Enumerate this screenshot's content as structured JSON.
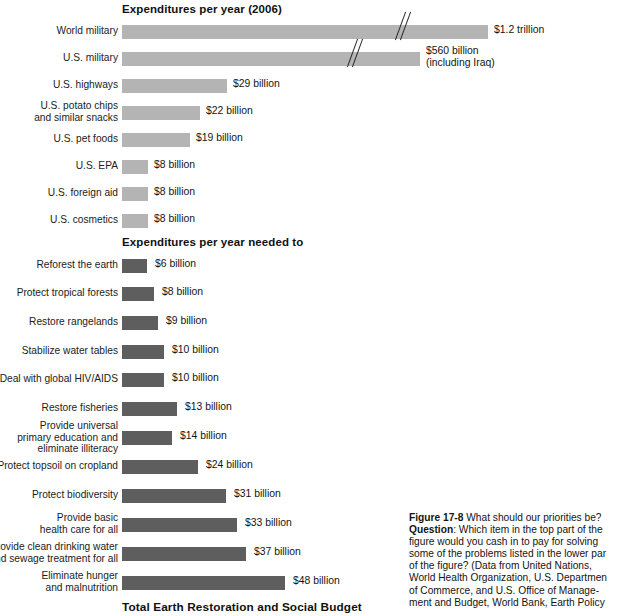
{
  "figure": {
    "top_section_title": "Expenditures per year (2006)",
    "bottom_section_title": "Expenditures per year needed to",
    "total_title": "Total Earth Restoration and Social Budget",
    "colors": {
      "top_bar": "#b4b4b4",
      "bottom_bar": "#5e5e5e",
      "text": "#141414",
      "background": "#ffffff"
    }
  },
  "caption": {
    "figure_number": "Figure 17-8",
    "title_text": " What should our priorities be?",
    "question_label": "Question",
    "question_text": ": Which item in the top part of the",
    "lines": [
      "figure would you cash in to pay for solving",
      "some of the problems listed in the lower par",
      "of the figure? (Data from United Nations,",
      "World Health Organization, U.S. Departmen",
      "of Commerce, and U.S. Office of Manage-",
      "ment and Budget, World Bank, Earth Policy"
    ]
  },
  "chart_data": {
    "type": "bar",
    "title": "What should our priorities be?",
    "xlabel": "",
    "ylabel": "",
    "orientation": "horizontal",
    "grid": false,
    "legend": false,
    "units": "US dollars per year",
    "panels": [
      {
        "name": "Expenditures per year (2006)",
        "bar_color": "#b4b4b4",
        "categories": [
          "World military",
          "U.S. military",
          "U.S. highways",
          "U.S. potato chips\nand similar snacks",
          "U.S. pet foods",
          "U.S. EPA",
          "U.S. foreign aid",
          "U.S. cosmetics"
        ],
        "values": [
          1200,
          560,
          29,
          22,
          19,
          8,
          8,
          8
        ],
        "value_labels": [
          "$1.2 trillion",
          "$560 billion\n(including Iraq)",
          "$29 billion",
          "$22 billion",
          "$19 billion",
          "$8 billion",
          "$8 billion",
          "$8 billion"
        ],
        "axis_broken": [
          true,
          true,
          false,
          false,
          false,
          false,
          false,
          false
        ],
        "note": "Bars for World military and U.S. military are drawn with an axis break (double-slash) because their values greatly exceed the scale."
      },
      {
        "name": "Expenditures per year needed to",
        "bar_color": "#5e5e5e",
        "categories": [
          "Reforest the earth",
          "Protect tropical forests",
          "Restore rangelands",
          "Stabilize water tables",
          "Deal with global HIV/AIDS",
          "Restore fisheries",
          "Provide universal\nprimary education and\neliminate illiteracy",
          "Protect topsoil on cropland",
          "Protect biodiversity",
          "Provide basic\nhealth care for all",
          "Provide clean drinking water\nand sewage treatment for all",
          "Eliminate hunger\nand malnutrition"
        ],
        "values": [
          6,
          8,
          9,
          10,
          10,
          13,
          14,
          24,
          31,
          33,
          37,
          48
        ],
        "value_labels": [
          "$6 billion",
          "$8 billion",
          "$9 billion",
          "$10 billion",
          "$10 billion",
          "$13 billion",
          "$14 billion",
          "$24 billion",
          "$31 billion",
          "$33 billion",
          "$37 billion",
          "$48 billion"
        ],
        "axis_broken": [
          false,
          false,
          false,
          false,
          false,
          false,
          false,
          false,
          false,
          false,
          false,
          false
        ],
        "footer": "Total Earth Restoration and Social Budget"
      }
    ]
  },
  "layout": {
    "top_rows": [
      {
        "y": 25,
        "bar_w": 366,
        "label_y": 25,
        "val_x": 494,
        "val_y": 24,
        "break_x": 396,
        "break_y": 11
      },
      {
        "y": 52,
        "bar_w": 298,
        "label_y": 52,
        "val_x": 426,
        "val_y": 45,
        "break_x": 348,
        "break_y": 38
      },
      {
        "y": 79,
        "bar_w": 105,
        "label_y": 79,
        "val_x": 233,
        "val_y": 78
      },
      {
        "y": 106,
        "bar_w": 78,
        "label_y": 100,
        "val_x": 206,
        "val_y": 105
      },
      {
        "y": 133,
        "bar_w": 68,
        "label_y": 133,
        "val_x": 196,
        "val_y": 132
      },
      {
        "y": 160,
        "bar_w": 26,
        "label_y": 160,
        "val_x": 154,
        "val_y": 159
      },
      {
        "y": 187,
        "bar_w": 26,
        "label_y": 187,
        "val_x": 154,
        "val_y": 186
      },
      {
        "y": 214,
        "bar_w": 26,
        "label_y": 214,
        "val_x": 154,
        "val_y": 213
      }
    ],
    "bottom_rows": [
      {
        "y": 259,
        "bar_w": 25,
        "label_y": 259,
        "val_x": 155,
        "val_y": 258
      },
      {
        "y": 287,
        "bar_w": 32,
        "label_y": 287,
        "val_x": 162,
        "val_y": 286
      },
      {
        "y": 316,
        "bar_w": 36,
        "label_y": 316,
        "val_x": 166,
        "val_y": 315
      },
      {
        "y": 345,
        "bar_w": 42,
        "label_y": 345,
        "val_x": 172,
        "val_y": 344
      },
      {
        "y": 373,
        "bar_w": 42,
        "label_y": 373,
        "val_x": 172,
        "val_y": 372
      },
      {
        "y": 402,
        "bar_w": 55,
        "label_y": 402,
        "val_x": 185,
        "val_y": 401
      },
      {
        "y": 431,
        "bar_w": 50,
        "label_y": 420,
        "val_x": 180,
        "val_y": 430
      },
      {
        "y": 460,
        "bar_w": 76,
        "label_y": 460,
        "val_x": 206,
        "val_y": 459
      },
      {
        "y": 489,
        "bar_w": 104,
        "label_y": 489,
        "val_x": 234,
        "val_y": 488
      },
      {
        "y": 518,
        "bar_w": 115,
        "label_y": 512,
        "val_x": 245,
        "val_y": 517
      },
      {
        "y": 547,
        "bar_w": 124,
        "label_y": 541,
        "val_x": 254,
        "val_y": 546
      },
      {
        "y": 576,
        "bar_w": 163,
        "label_y": 570,
        "val_x": 293,
        "val_y": 575
      }
    ]
  }
}
